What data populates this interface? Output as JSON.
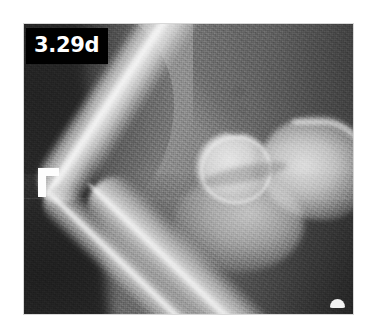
{
  "figure": {
    "kind": "radiograph",
    "modality": "X-ray",
    "view": "lateral elbow",
    "alt_description": "Grayscale lateral radiograph of an elbow joint showing the humerus, humeral condyle, olecranon, radius and ulna"
  },
  "overlays": {
    "timestamp_label": {
      "text": "3.29d",
      "background_color": "#000000",
      "text_color": "#ffffff"
    },
    "laterality_marker": {
      "symbol": "Γ",
      "name": "L-marker",
      "color": "#fdfdfd"
    },
    "edge_artifact": {
      "name": "white dome artifact",
      "color": "#f2f2f2"
    }
  },
  "anatomy": [
    {
      "id": "humerus",
      "label": "Humerus"
    },
    {
      "id": "humeral-condyle",
      "label": "Humeral condyle"
    },
    {
      "id": "olecranon",
      "label": "Olecranon"
    },
    {
      "id": "joint-space",
      "label": "Elbow joint space"
    },
    {
      "id": "radius",
      "label": "Radius"
    },
    {
      "id": "ulna",
      "label": "Ulna"
    }
  ],
  "palette": {
    "page_background": "#ffffff",
    "film_dark": "#242424",
    "film_mid": "#6e6e6e",
    "bone_bright": "#ebebeb",
    "label_black": "#000000",
    "marker_white": "#fdfdfd"
  }
}
